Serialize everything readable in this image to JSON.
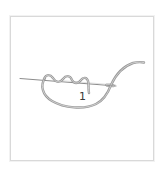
{
  "figure": {
    "step_label": "1",
    "wraps_count": 3,
    "colors": {
      "frame_border": "#d9d9d9",
      "thread": "#9a9a9a",
      "thread_highlight": "#d4d4d4",
      "needle": "#8c8c8c",
      "label": "#3a3a3a"
    }
  }
}
